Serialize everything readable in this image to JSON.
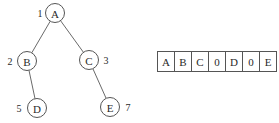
{
  "tree": {
    "nodes": [
      {
        "id": "A",
        "label": "A",
        "index": "1",
        "cx": 55,
        "cy": 13,
        "idx_x": 40,
        "idx_y": 13
      },
      {
        "id": "B",
        "label": "B",
        "index": "2",
        "cx": 27,
        "cy": 61,
        "idx_x": 10,
        "idx_y": 61
      },
      {
        "id": "C",
        "label": "C",
        "index": "3",
        "cx": 89,
        "cy": 60,
        "idx_x": 106,
        "idx_y": 60
      },
      {
        "id": "D",
        "label": "D",
        "index": "5",
        "cx": 37,
        "cy": 108,
        "idx_x": 19,
        "idx_y": 108
      },
      {
        "id": "E",
        "label": "E",
        "index": "7",
        "cx": 110,
        "cy": 107,
        "idx_x": 128,
        "idx_y": 107
      }
    ],
    "edges": [
      {
        "from": "A",
        "to": "B"
      },
      {
        "from": "A",
        "to": "C"
      },
      {
        "from": "B",
        "to": "D"
      },
      {
        "from": "C",
        "to": "E"
      }
    ],
    "node_radius": 9.5
  },
  "array": {
    "cells": [
      "A",
      "B",
      "C",
      "0",
      "D",
      "0",
      "E"
    ]
  },
  "caption": {
    "text": ""
  }
}
